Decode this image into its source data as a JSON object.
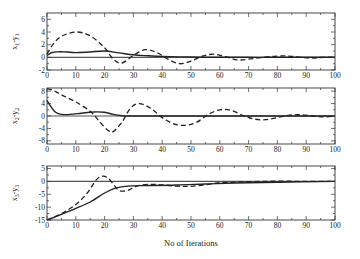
{
  "chart_data": [
    {
      "type": "line",
      "ylabel": "x1-y1",
      "ylabel_main": "x",
      "ylabel_sub1": "1",
      "ylabel_dash": "-y",
      "ylabel_sub2": "1",
      "xlabel": "",
      "xlim": [
        0,
        100
      ],
      "ylim": [
        -2,
        7
      ],
      "yticks": [
        -2,
        0,
        2,
        4,
        6
      ],
      "ytick_labels": [
        "-2",
        "0",
        "2",
        "4",
        "6"
      ],
      "xticks": [
        0,
        10,
        20,
        30,
        40,
        50,
        60,
        70,
        80,
        90,
        100
      ],
      "xtick_labels": [
        "0",
        "10",
        "20",
        "30",
        "40",
        "50",
        "60",
        "70",
        "80",
        "90",
        "100"
      ],
      "reference_line": 0,
      "series": [
        {
          "name": "solid",
          "style": "solid",
          "x": [
            0,
            2,
            5,
            10,
            15,
            20,
            25,
            30,
            35,
            40,
            50,
            60,
            70,
            80,
            90,
            100
          ],
          "y": [
            0.3,
            0.8,
            0.9,
            0.75,
            0.85,
            1.0,
            0.7,
            0.4,
            0.25,
            0.15,
            0.05,
            0.02,
            0.0,
            0.0,
            0.0,
            0.0
          ]
        },
        {
          "name": "dashed",
          "style": "dashed",
          "x": [
            0,
            2,
            5,
            10,
            15,
            20,
            23,
            26,
            30,
            34,
            38,
            42,
            46,
            50,
            54,
            58,
            62,
            66,
            70,
            75,
            80,
            84,
            88,
            92,
            96,
            100
          ],
          "y": [
            0.5,
            2.0,
            3.3,
            4.0,
            3.4,
            1.5,
            -0.3,
            -0.9,
            0.3,
            1.2,
            0.8,
            -0.3,
            -1.0,
            -0.6,
            0.2,
            0.5,
            0.1,
            -0.4,
            -0.3,
            0.0,
            0.2,
            0.2,
            0.0,
            -0.1,
            0.0,
            0.0
          ]
        }
      ]
    },
    {
      "type": "line",
      "ylabel_main": "x",
      "ylabel_sub1": "2",
      "ylabel_dash": "-y",
      "ylabel_sub2": "2",
      "xlabel": "",
      "xlim": [
        0,
        100
      ],
      "ylim": [
        -9,
        9
      ],
      "yticks": [
        -8,
        -4,
        0,
        4,
        8
      ],
      "ytick_labels": [
        "-8",
        "-4",
        "0",
        "4",
        "8"
      ],
      "xticks": [
        0,
        10,
        20,
        30,
        40,
        50,
        60,
        70,
        80,
        90,
        100
      ],
      "xtick_labels": [
        "0",
        "10",
        "20",
        "30",
        "40",
        "50",
        "60",
        "70",
        "80",
        "90",
        "100"
      ],
      "reference_line": 0,
      "series": [
        {
          "name": "solid",
          "style": "solid",
          "x": [
            0,
            1,
            3,
            5,
            8,
            12,
            16,
            20,
            23,
            26,
            30,
            40,
            50,
            100
          ],
          "y": [
            5.0,
            3.5,
            1.2,
            0.5,
            0.5,
            0.9,
            1.3,
            1.2,
            0.5,
            0.1,
            0.0,
            0.0,
            0.0,
            0.0
          ]
        },
        {
          "name": "dashed",
          "style": "dashed",
          "x": [
            0,
            2,
            5,
            10,
            15,
            18,
            21,
            23,
            26,
            29,
            32,
            36,
            40,
            44,
            48,
            52,
            56,
            60,
            64,
            68,
            72,
            76,
            80,
            84,
            88,
            92,
            96,
            100
          ],
          "y": [
            8.8,
            8.3,
            6.8,
            4.5,
            1.5,
            -1.5,
            -4.5,
            -5.0,
            -2.0,
            2.5,
            4.0,
            2.5,
            -0.5,
            -2.5,
            -3.0,
            -2.0,
            0.5,
            2.0,
            1.8,
            0.2,
            -1.0,
            -1.2,
            -0.5,
            0.3,
            0.4,
            0.0,
            -0.3,
            0.0
          ]
        }
      ]
    },
    {
      "type": "line",
      "ylabel_main": "x",
      "ylabel_sub1": "3",
      "ylabel_dash": "-y",
      "ylabel_sub2": "3",
      "xlabel": "No of Iterations",
      "xlim": [
        0,
        100
      ],
      "ylim": [
        -15,
        6
      ],
      "yticks": [
        -15,
        -10,
        -5,
        0,
        5
      ],
      "ytick_labels": [
        "-15",
        "-10",
        "-5",
        "0",
        "5"
      ],
      "xticks": [
        0,
        10,
        20,
        30,
        40,
        50,
        60,
        70,
        80,
        90,
        100
      ],
      "xtick_labels": [
        "0",
        "10",
        "20",
        "30",
        "40",
        "50",
        "60",
        "70",
        "80",
        "90",
        "100"
      ],
      "reference_line": 0,
      "series": [
        {
          "name": "solid",
          "style": "solid",
          "x": [
            0,
            5,
            10,
            15,
            20,
            24,
            28,
            35,
            45,
            55,
            65,
            80,
            100
          ],
          "y": [
            -15,
            -12.8,
            -10.5,
            -8,
            -4.5,
            -2.5,
            -1.8,
            -1.6,
            -1.4,
            -1.0,
            -0.6,
            -0.3,
            0.0
          ]
        },
        {
          "name": "dashed",
          "style": "dashed",
          "x": [
            0,
            5,
            10,
            14,
            17,
            19,
            21,
            23,
            25,
            28,
            32,
            38,
            45,
            50,
            55,
            60,
            65,
            70,
            80,
            90,
            100
          ],
          "y": [
            -15,
            -12.5,
            -9,
            -4.5,
            0.5,
            2.0,
            1.5,
            -1.0,
            -3.5,
            -3.5,
            -1.5,
            -1.2,
            -1.8,
            -1.9,
            -1.3,
            -0.5,
            -0.3,
            -0.1,
            0.1,
            0.0,
            0.0
          ]
        }
      ]
    }
  ],
  "panels": [
    {
      "top": 13,
      "bottom": 70
    },
    {
      "top": 88,
      "bottom": 144
    },
    {
      "top": 166,
      "bottom": 220
    }
  ],
  "xlabel": "No of Iterations"
}
